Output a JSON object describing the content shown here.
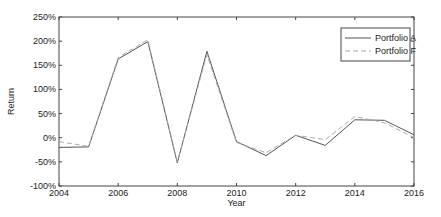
{
  "chart_data": {
    "type": "line",
    "title": "",
    "xlabel": "Year",
    "ylabel": "Return",
    "x": [
      2004,
      2005,
      2006,
      2007,
      2008,
      2009,
      2010,
      2011,
      2012,
      2013,
      2014,
      2015,
      2016
    ],
    "xlim": [
      2004,
      2016
    ],
    "ylim": [
      -100,
      250
    ],
    "xticks": [
      2004,
      2006,
      2008,
      2010,
      2012,
      2014,
      2016
    ],
    "xtick_labels": [
      "2004",
      "2006",
      "2008",
      "2010",
      "2012",
      "2014",
      "2016"
    ],
    "yticks": [
      -100,
      -50,
      0,
      50,
      100,
      150,
      200,
      250
    ],
    "ytick_labels": [
      "-100%",
      "-50%",
      "0%",
      "50%",
      "100%",
      "150%",
      "200%",
      "250%"
    ],
    "grid": false,
    "legend_position": "top-right",
    "series": [
      {
        "name": "Portfolio A",
        "style": "solid",
        "color": "#555555",
        "values": [
          -20,
          -19,
          163,
          199,
          -52,
          179,
          -8,
          -37,
          5,
          -16,
          37,
          36,
          6
        ]
      },
      {
        "name": "Portfolio F",
        "style": "dashed",
        "color": "#aaaaaa",
        "values": [
          -8,
          -18,
          166,
          203,
          -50,
          172,
          -10,
          -31,
          5,
          -4,
          44,
          31,
          0
        ]
      }
    ]
  }
}
